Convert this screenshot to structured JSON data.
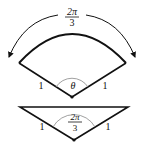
{
  "sector": {
    "arc_label_num": "2π",
    "arc_label_den": "3",
    "angle_label": "θ",
    "left_side": "1",
    "right_side": "1"
  },
  "triangle": {
    "angle_label_num": "2π",
    "angle_label_den": "3",
    "left_side": "1",
    "right_side": "1"
  },
  "colors": {
    "stroke": "#111111",
    "angle_mark": "#888888"
  }
}
